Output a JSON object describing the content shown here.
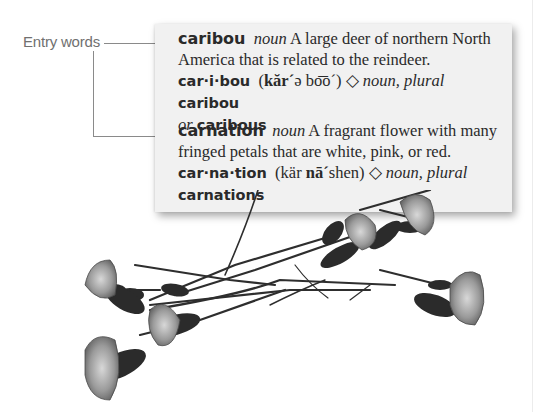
{
  "callout": {
    "label": "Entry words"
  },
  "entries": [
    {
      "headword": "caribou",
      "part_of_speech": "noun",
      "definition": "A large deer of northern North America that is related to the reindeer.",
      "syllabification": "car·i·bou",
      "pron_open": "(",
      "pron_bold": "kăr´",
      "pron_rest": "ə bo͞o´)",
      "diamond": "◇",
      "inflection_label": "noun, plural",
      "plural_1": "caribou",
      "or_label": "or",
      "plural_2": "caribous"
    },
    {
      "headword": "carnation",
      "part_of_speech": "noun",
      "definition": "A fragrant flower with many fringed petals that are white, pink, or red.",
      "syllabification": "car·na·tion",
      "pron_open": "(kär ",
      "pron_bold": "nā´",
      "pron_rest": "shen)",
      "diamond": "◇",
      "inflection_label": "noun, plural",
      "plural_1": "carnations"
    }
  ],
  "illustration": {
    "subject": "carnation-flowers",
    "color_mode": "grayscale"
  },
  "colors": {
    "card_bg": "#f1f1f1",
    "text": "#2a2a2a",
    "callout_text": "#707070",
    "connector": "#8a8a8a"
  }
}
